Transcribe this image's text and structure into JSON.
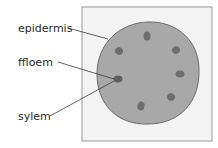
{
  "diagram": {
    "type": "cross-section of plant stem",
    "labels": [
      {
        "id": "epidermis",
        "text": "epidermis"
      },
      {
        "id": "phloem",
        "text": "ffloem"
      },
      {
        "id": "xylem",
        "text": "sylem"
      }
    ],
    "colors": {
      "panel_fill": "#f3f3f3",
      "panel_stroke": "#9a9a9a",
      "stem_fill": "#a8a8a8",
      "stem_stroke": "#6a6a6a",
      "bundle_fill": "#6e6e6e",
      "leader_line": "#3a3a3a",
      "text": "#2a2a2a"
    },
    "vascular_bundle_count": 7
  }
}
